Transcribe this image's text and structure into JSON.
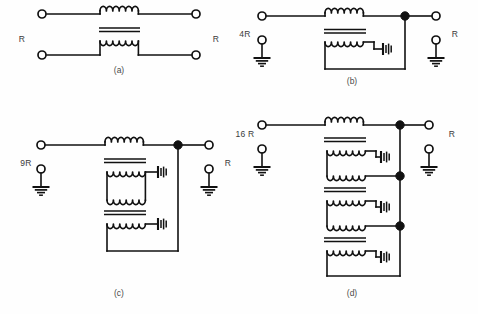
{
  "figure": {
    "background_color": "#fefefe",
    "line_color": "#111111",
    "label_color": "#3a3a3a",
    "panels": [
      {
        "id": "a",
        "caption": "(a)",
        "left_label": "R",
        "right_label": "R",
        "transformer_stages": 1,
        "ground_count": 0,
        "junction_dots": 0,
        "cell_count": 0,
        "open_terminals": 4,
        "description": "Two-winding transformer with balanced input and output, R on both sides"
      },
      {
        "id": "b",
        "caption": "(b)",
        "left_label": "4R",
        "right_label": "R",
        "transformer_stages": 1,
        "ground_count": 2,
        "junction_dots": 1,
        "cell_count": 1,
        "open_terminals": 4,
        "description": "Single autotransformer stage, 4R input matched to R output"
      },
      {
        "id": "c",
        "caption": "(c)",
        "left_label": "9R",
        "right_label": "R",
        "transformer_stages": 2,
        "ground_count": 2,
        "junction_dots": 1,
        "cell_count": 2,
        "open_terminals": 4,
        "description": "Two cascaded transformer stages, 9R input matched to R output"
      },
      {
        "id": "d",
        "caption": "(d)",
        "left_label": "16 R",
        "right_label": "R",
        "transformer_stages": 3,
        "ground_count": 2,
        "junction_dots": 3,
        "cell_count": 3,
        "open_terminals": 4,
        "description": "Three cascaded transformer stages, 16 R input matched to R output"
      }
    ]
  }
}
